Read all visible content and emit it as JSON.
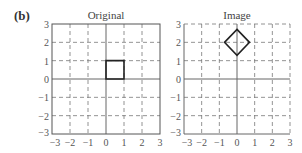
{
  "panel_label": "(b)",
  "plots": [
    {
      "title": "Original",
      "xlim": [
        -3,
        3
      ],
      "ylim": [
        -3,
        3
      ],
      "xticks": [
        "−3",
        "−2",
        "−1",
        "0",
        "1",
        "2",
        "3"
      ],
      "yticks": [
        "3",
        "2",
        "1",
        "0",
        "−1",
        "−2",
        "−3"
      ],
      "shape": {
        "type": "square",
        "vertices": [
          [
            0,
            0
          ],
          [
            1,
            0
          ],
          [
            1,
            1
          ],
          [
            0,
            1
          ]
        ]
      }
    },
    {
      "title": "Image",
      "xlim": [
        -3,
        3
      ],
      "ylim": [
        -3,
        3
      ],
      "xticks": [
        "−3",
        "−2",
        "−1",
        "0",
        "1",
        "2",
        "3"
      ],
      "yticks": [
        "3",
        "2",
        "1",
        "0",
        "−1",
        "−2",
        "−3"
      ],
      "shape": {
        "type": "diamond",
        "vertices": [
          [
            0,
            2.707
          ],
          [
            0.707,
            2
          ],
          [
            0,
            1.293
          ],
          [
            -0.707,
            2
          ]
        ]
      }
    }
  ]
}
